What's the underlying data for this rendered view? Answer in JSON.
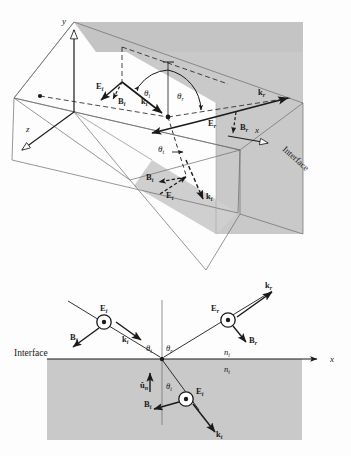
{
  "figure": {
    "colors": {
      "plane_fill": "#c9c9c9",
      "plane_fill_light": "#d4d4d4",
      "medium_fill": "#c9c9c9",
      "line": "#1a1a1a",
      "background": "#fdfdfd"
    }
  },
  "upper_diagram": {
    "name": "three-dimensional-perspective-view",
    "axes": [
      {
        "id": "y",
        "label": "y",
        "direction": "up"
      },
      {
        "id": "z",
        "label": "z",
        "direction": "down-left"
      },
      {
        "id": "x",
        "label": "x",
        "direction": "right"
      }
    ],
    "interface_label": "Interface",
    "angles": [
      {
        "id": "theta_i",
        "label": "θ",
        "sub": "i"
      },
      {
        "id": "theta_r",
        "label": "θ",
        "sub": "r"
      },
      {
        "id": "theta_t",
        "label": "θ",
        "sub": "t"
      }
    ],
    "vectors": [
      {
        "id": "E_i",
        "label": "E",
        "sub": "i",
        "kind": "field"
      },
      {
        "id": "B_i",
        "label": "B",
        "sub": "i",
        "kind": "field"
      },
      {
        "id": "k_i",
        "label": "k",
        "sub": "i",
        "kind": "wave"
      },
      {
        "id": "E_r",
        "label": "E",
        "sub": "r",
        "kind": "field"
      },
      {
        "id": "B_r",
        "label": "B",
        "sub": "r",
        "kind": "field"
      },
      {
        "id": "k_r",
        "label": "k",
        "sub": "r",
        "kind": "wave"
      },
      {
        "id": "E_t",
        "label": "E",
        "sub": "t",
        "kind": "field"
      },
      {
        "id": "B_t",
        "label": "B",
        "sub": "t",
        "kind": "field"
      },
      {
        "id": "k_t",
        "label": "k",
        "sub": "t",
        "kind": "wave"
      }
    ]
  },
  "lower_diagram": {
    "name": "two-dimensional-plane-of-incidence-view",
    "interface_label": "Interface",
    "axis_x_label": "x",
    "normal_label": "u",
    "normal_sub": "n",
    "index_incident": "n",
    "index_incident_sub": "i",
    "index_transmitted": "n",
    "index_transmitted_sub": "t",
    "angles": [
      {
        "id": "theta_i",
        "label": "θ",
        "sub": "i"
      },
      {
        "id": "theta_r",
        "label": "θ",
        "sub": "r"
      },
      {
        "id": "theta_t",
        "label": "θ",
        "sub": "t"
      }
    ],
    "vectors": [
      {
        "id": "E_i",
        "label": "E",
        "sub": "i",
        "kind": "out-of-page"
      },
      {
        "id": "B_i",
        "label": "B",
        "sub": "i",
        "kind": "field"
      },
      {
        "id": "k_i",
        "label": "k",
        "sub": "i",
        "kind": "wave"
      },
      {
        "id": "E_r",
        "label": "E",
        "sub": "r",
        "kind": "out-of-page"
      },
      {
        "id": "B_r",
        "label": "B",
        "sub": "r",
        "kind": "field"
      },
      {
        "id": "k_r",
        "label": "k",
        "sub": "r",
        "kind": "wave"
      },
      {
        "id": "E_t",
        "label": "E",
        "sub": "t",
        "kind": "out-of-page"
      },
      {
        "id": "B_t",
        "label": "B",
        "sub": "t",
        "kind": "field"
      },
      {
        "id": "k_t",
        "label": "k",
        "sub": "t",
        "kind": "wave"
      }
    ]
  }
}
